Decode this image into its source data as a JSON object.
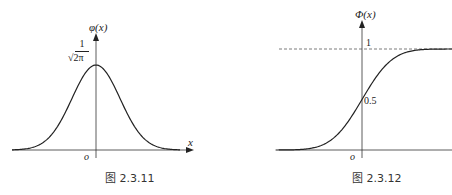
{
  "chart_data": [
    {
      "type": "line",
      "title": "",
      "caption": "图 2.3.11",
      "xlabel": "x",
      "ylabel": "φ(x)",
      "origin_label": "o",
      "peak_label_num": "1",
      "peak_label_den": "√2π",
      "series": [
        {
          "name": "φ(x) standard normal density",
          "x": [
            -3.5,
            -3,
            -2,
            -1,
            0,
            1,
            2,
            3,
            3.5
          ],
          "values": [
            0.001,
            0.004,
            0.054,
            0.242,
            0.399,
            0.242,
            0.054,
            0.004,
            0.001
          ]
        }
      ],
      "xlim": [
        -3.6,
        3.9
      ],
      "ylim": [
        0,
        0.5
      ],
      "grid": false,
      "legend": null
    },
    {
      "type": "line",
      "title": "",
      "caption": "图 2.3.12",
      "xlabel": "",
      "ylabel": "Φ(x)",
      "origin_label": "o",
      "tick_one": "1",
      "tick_half": "0.5",
      "series": [
        {
          "name": "Φ(x) standard normal CDF",
          "x": [
            -3.5,
            -3,
            -2,
            -1,
            0,
            1,
            2,
            3,
            3.5
          ],
          "values": [
            0.0002,
            0.001,
            0.023,
            0.159,
            0.5,
            0.841,
            0.977,
            0.999,
            1.0
          ]
        }
      ],
      "reference_lines": [
        {
          "y": 1,
          "style": "dashed"
        }
      ],
      "xlim": [
        -3.6,
        3.6
      ],
      "ylim": [
        0,
        1.1
      ],
      "grid": false,
      "legend": null
    }
  ]
}
